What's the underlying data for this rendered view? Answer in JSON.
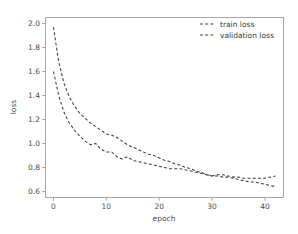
{
  "chart_data": {
    "type": "line",
    "title": "",
    "xlabel": "epoch",
    "ylabel": "loss",
    "xlim": [
      -1.5,
      43.5
    ],
    "ylim": [
      0.55,
      2.05
    ],
    "xticks": [
      0,
      10,
      20,
      30,
      40
    ],
    "xtick_labels": [
      "0",
      "10",
      "20",
      "30",
      "40"
    ],
    "yticks": [
      0.6,
      0.8,
      1.0,
      1.2,
      1.4,
      1.6,
      1.8,
      2.0
    ],
    "ytick_labels": [
      "0.6",
      "0.8",
      "1.0",
      "1.2",
      "1.4",
      "1.6",
      "1.8",
      "2.0"
    ],
    "grid": false,
    "legend_position": "upper right",
    "line_color": "#3f3f3f",
    "linestyle": "dashed",
    "x": [
      0,
      1,
      2,
      3,
      4,
      5,
      6,
      7,
      8,
      9,
      10,
      11,
      12,
      13,
      14,
      15,
      16,
      17,
      18,
      19,
      20,
      21,
      22,
      23,
      24,
      25,
      26,
      27,
      28,
      29,
      30,
      31,
      32,
      33,
      34,
      35,
      36,
      37,
      38,
      39,
      40,
      41,
      42
    ],
    "series": [
      {
        "name": "train loss",
        "values": [
          1.6,
          1.4,
          1.26,
          1.17,
          1.11,
          1.06,
          1.02,
          0.99,
          1.0,
          0.95,
          0.93,
          0.93,
          0.89,
          0.87,
          0.89,
          0.86,
          0.85,
          0.84,
          0.83,
          0.82,
          0.81,
          0.8,
          0.79,
          0.79,
          0.79,
          0.78,
          0.77,
          0.76,
          0.75,
          0.74,
          0.73,
          0.73,
          0.72,
          0.72,
          0.71,
          0.7,
          0.69,
          0.68,
          0.68,
          0.67,
          0.66,
          0.65,
          0.64
        ]
      },
      {
        "name": "validation loss",
        "values": [
          1.97,
          1.68,
          1.5,
          1.39,
          1.31,
          1.25,
          1.21,
          1.17,
          1.14,
          1.11,
          1.08,
          1.07,
          1.05,
          1.02,
          0.99,
          0.97,
          0.95,
          0.93,
          0.91,
          0.9,
          0.88,
          0.86,
          0.85,
          0.83,
          0.82,
          0.8,
          0.79,
          0.77,
          0.76,
          0.74,
          0.73,
          0.74,
          0.74,
          0.73,
          0.72,
          0.72,
          0.71,
          0.71,
          0.71,
          0.71,
          0.71,
          0.72,
          0.73
        ]
      }
    ]
  },
  "legend": {
    "entries": [
      {
        "label": "train loss"
      },
      {
        "label": "validation loss"
      }
    ]
  }
}
